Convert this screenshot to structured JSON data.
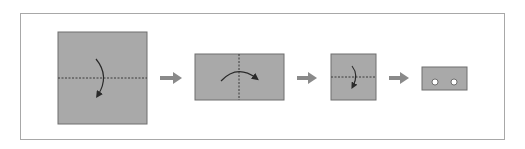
{
  "diagram": {
    "colors": {
      "paper": "#a9a9a9",
      "paper_border": "#6e6e6e",
      "arrow": "#8a8a8a",
      "fold_line": "#3a3a3a",
      "frame": "#a8a8a8",
      "hole": "#ffffff"
    },
    "steps": [
      {
        "id": "step-1",
        "shape": "square",
        "fold": "horizontal-valley",
        "curve_arrow": "downward"
      },
      {
        "id": "step-2",
        "shape": "rectangle",
        "fold": "vertical-valley",
        "curve_arrow": "rightward"
      },
      {
        "id": "step-3",
        "shape": "square",
        "fold": "horizontal-valley",
        "curve_arrow": "downward"
      },
      {
        "id": "step-4",
        "shape": "rectangle",
        "holes": 2
      }
    ],
    "transition_arrows": 3
  }
}
